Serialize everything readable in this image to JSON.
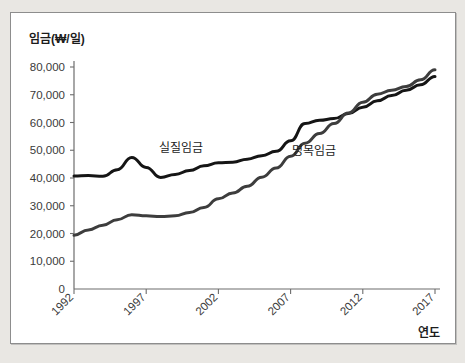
{
  "figure": {
    "background_color": "#e9e7e3",
    "panel_color": "#ffffff",
    "border_color": "#8d8d8d"
  },
  "chart_data": {
    "type": "line",
    "title": "",
    "subtitle": "",
    "ylabel": "임금(₩/일)",
    "xlabel": "연도",
    "ylim": [
      0,
      80000
    ],
    "xlim": [
      1992,
      2017
    ],
    "grid": false,
    "legend_position": "inline-annotation",
    "ytick_labels": [
      "80,000",
      "70,000",
      "60,000",
      "50,000",
      "40,000",
      "30,000",
      "20,000",
      "10,000",
      "0"
    ],
    "ytick_values": [
      80000,
      70000,
      60000,
      50000,
      40000,
      30000,
      20000,
      10000,
      0
    ],
    "xtick_labels": [
      "1992",
      "1997",
      "2002",
      "2007",
      "2012",
      "2017"
    ],
    "xtick_values": [
      1992,
      1997,
      2002,
      2007,
      2012,
      2017
    ],
    "x": [
      1992,
      1993,
      1994,
      1995,
      1996,
      1997,
      1998,
      1999,
      2000,
      2001,
      2002,
      2003,
      2004,
      2005,
      2006,
      2007,
      2008,
      2009,
      2010,
      2011,
      2012,
      2013,
      2014,
      2015,
      2016,
      2017
    ],
    "series": [
      {
        "name": "실질임금",
        "label": "실질임금",
        "color": "#151515",
        "line_width": 3.0,
        "values": [
          40700,
          40900,
          40600,
          43000,
          47400,
          43800,
          40200,
          41300,
          42700,
          44400,
          45500,
          45700,
          46800,
          48000,
          49600,
          53400,
          59600,
          60800,
          61400,
          63200,
          65500,
          67800,
          69700,
          71600,
          73600,
          76600
        ]
      },
      {
        "name": "명목임금",
        "label": "명목임금",
        "color": "#3d3d3d",
        "line_width": 3.0,
        "values": [
          19400,
          21300,
          23000,
          25000,
          26800,
          26400,
          26100,
          26400,
          27600,
          29400,
          32500,
          34600,
          37000,
          40300,
          43600,
          47800,
          52500,
          56000,
          59600,
          63400,
          67300,
          70200,
          71600,
          73000,
          75400,
          79000
        ]
      }
    ],
    "annotations": [
      {
        "text": "실질임금",
        "x": 1997.9,
        "y": 49200
      },
      {
        "text": "명목임금",
        "x": 2007.1,
        "y": 48300
      }
    ]
  }
}
